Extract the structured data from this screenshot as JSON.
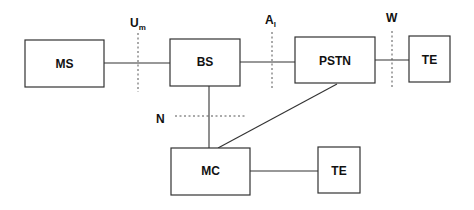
{
  "diagram": {
    "nodes": {
      "ms": "MS",
      "bs": "BS",
      "pstn": "PSTN",
      "te_top": "TE",
      "mc": "MC",
      "te_bottom": "TE"
    },
    "interfaces": {
      "um": {
        "main": "U",
        "sub": "m"
      },
      "al": {
        "main": "A",
        "sub": "l"
      },
      "w": {
        "main": "W"
      },
      "n": {
        "main": "N"
      }
    },
    "connections": [
      [
        "MS",
        "BS"
      ],
      [
        "BS",
        "PSTN"
      ],
      [
        "PSTN",
        "TE"
      ],
      [
        "BS",
        "MC"
      ],
      [
        "PSTN",
        "MC"
      ],
      [
        "MC",
        "TE"
      ]
    ]
  }
}
